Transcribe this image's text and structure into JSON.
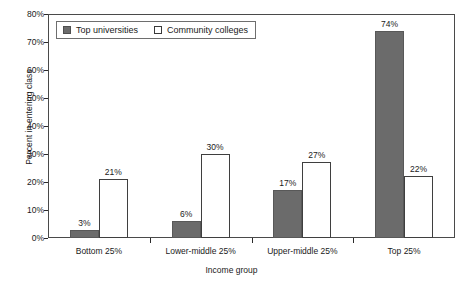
{
  "chart_data": {
    "type": "bar",
    "title": "",
    "xlabel": "Income group",
    "ylabel": "Percent in entering class",
    "categories": [
      "Bottom 25%",
      "Lower-middle 25%",
      "Upper-middle 25%",
      "Top 25%"
    ],
    "series": [
      {
        "name": "Top universities",
        "values": [
          3,
          6,
          17,
          74
        ],
        "labels": [
          "3%",
          "6%",
          "17%",
          "74%"
        ],
        "color": "#6b6b6b",
        "style": "filled"
      },
      {
        "name": "Community colleges",
        "values": [
          21,
          30,
          27,
          22
        ],
        "labels": [
          "21%",
          "30%",
          "27%",
          "22%"
        ],
        "color": "#ffffff",
        "style": "open"
      }
    ],
    "ylim": [
      0,
      80
    ],
    "yticks": [
      0,
      10,
      20,
      30,
      40,
      50,
      60,
      70,
      80
    ],
    "ytick_labels": [
      "0%",
      "10%",
      "20%",
      "30%",
      "40%",
      "50%",
      "60%",
      "70%",
      "80%"
    ],
    "grid": false,
    "legend_position": "top-left-inside",
    "legend_entries": [
      "Top universities",
      "Community colleges"
    ],
    "frame": true
  }
}
